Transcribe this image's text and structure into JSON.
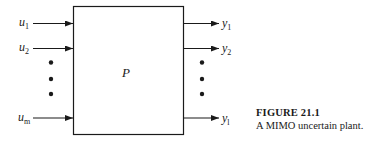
{
  "figure": {
    "block_label": "P",
    "inputs": [
      {
        "base": "u",
        "sub": "1"
      },
      {
        "base": "u",
        "sub": "2"
      },
      {
        "base": "u",
        "sub": "m"
      }
    ],
    "outputs": [
      {
        "base": "y",
        "sub": "1"
      },
      {
        "base": "y",
        "sub": "2"
      },
      {
        "base": "y",
        "sub": "l"
      }
    ],
    "caption": {
      "title": "FIGURE 21.1",
      "text": "A MIMO uncertain plant."
    }
  }
}
